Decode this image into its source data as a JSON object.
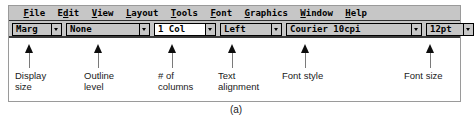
{
  "caption": "(a)",
  "menubar": {
    "items": [
      {
        "label": "File",
        "mnemonic": "F",
        "pre": "",
        "post": "ile"
      },
      {
        "label": "Edit",
        "mnemonic": "d",
        "pre": "E",
        "post": "it"
      },
      {
        "label": "View",
        "mnemonic": "V",
        "pre": "",
        "post": "iew"
      },
      {
        "label": "Layout",
        "mnemonic": "L",
        "pre": "",
        "post": "ayout"
      },
      {
        "label": "Tools",
        "mnemonic": "T",
        "pre": "",
        "post": "ools"
      },
      {
        "label": "Font",
        "mnemonic": "F",
        "pre": "",
        "post": "ont"
      },
      {
        "label": "Graphics",
        "mnemonic": "G",
        "pre": "",
        "post": "raphics"
      },
      {
        "label": "Window",
        "mnemonic": "W",
        "pre": "",
        "post": "indow"
      },
      {
        "label": "Help",
        "mnemonic": "H",
        "pre": "",
        "post": "elp"
      }
    ]
  },
  "ribbon": {
    "controls": [
      {
        "name": "display-size",
        "value": "Marg",
        "dropdown_icon": "chevron-down-icon",
        "highlighted": false
      },
      {
        "name": "outline-level",
        "value": "None",
        "dropdown_icon": "chevron-down-icon",
        "highlighted": false
      },
      {
        "name": "column-count",
        "value": "1 Col",
        "dropdown_icon": "chevron-down-icon",
        "highlighted": true
      },
      {
        "name": "text-alignment",
        "value": "Left",
        "dropdown_icon": "chevron-down-icon",
        "highlighted": false
      },
      {
        "name": "font-style",
        "value": "Courier 10cpi",
        "dropdown_icon": "chevron-down-icon",
        "highlighted": false
      },
      {
        "name": "font-size",
        "value": "12pt",
        "dropdown_icon": "chevron-down-icon",
        "highlighted": false
      }
    ]
  },
  "callouts": [
    {
      "name": "display-size",
      "text": "Display\nsize"
    },
    {
      "name": "outline-level",
      "text": "Outline\nlevel"
    },
    {
      "name": "column-count",
      "text": "# of\ncolumns"
    },
    {
      "name": "text-alignment",
      "text": "Text\nalignment"
    },
    {
      "name": "font-style",
      "text": "Font style"
    },
    {
      "name": "font-size",
      "text": "Font size"
    }
  ],
  "colors": {
    "chrome": "#c6c6c6",
    "field_highlight": "#ffffff",
    "border": "#000000",
    "frame": "#9a9a9a",
    "arrow": "#0d0d0d",
    "text": "#1a1a1a"
  }
}
